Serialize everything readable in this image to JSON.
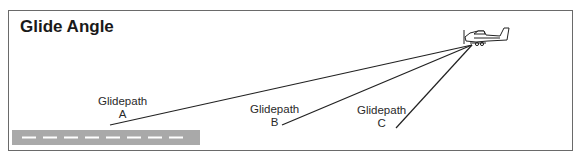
{
  "title": "Glide Angle",
  "glidepaths": [
    {
      "label": "Glidepath",
      "letter": "A"
    },
    {
      "label": "Glidepath",
      "letter": "B"
    },
    {
      "label": "Glidepath",
      "letter": "C"
    }
  ],
  "colors": {
    "runway": "#a9a9a9",
    "runway_marking": "#ffffff",
    "line": "#222222",
    "frame": "#6a6a6a"
  }
}
